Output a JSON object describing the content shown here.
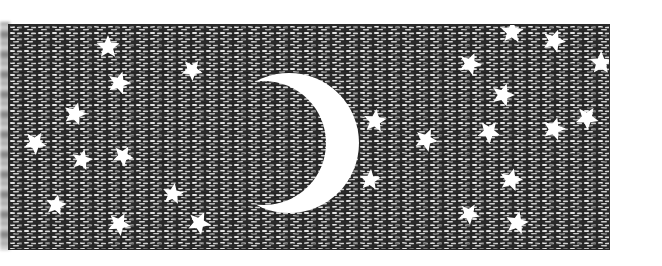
{
  "illustration": {
    "subject": "Crescent moon and stars in a night sky",
    "style": "black-and-white pen hatching",
    "colors": {
      "sky_dark": "#1e1e1e",
      "sky_light": "#e8e8e8",
      "moon": "#ffffff",
      "stars": "#ffffff",
      "page": "#ffffff"
    },
    "moon": {
      "cx": 280,
      "cy": 118,
      "r": 70,
      "cut_cx": 255,
      "cut_cy": 118,
      "cut_r": 62
    },
    "stars": [
      {
        "x": 99,
        "y": 22,
        "r": 12
      },
      {
        "x": 110,
        "y": 58,
        "r": 12
      },
      {
        "x": 183,
        "y": 45,
        "r": 11
      },
      {
        "x": 66,
        "y": 89,
        "r": 12
      },
      {
        "x": 26,
        "y": 118,
        "r": 12
      },
      {
        "x": 73,
        "y": 135,
        "r": 11
      },
      {
        "x": 114,
        "y": 131,
        "r": 11
      },
      {
        "x": 47,
        "y": 180,
        "r": 11
      },
      {
        "x": 110,
        "y": 199,
        "r": 12
      },
      {
        "x": 164,
        "y": 169,
        "r": 11
      },
      {
        "x": 190,
        "y": 198,
        "r": 12
      },
      {
        "x": 366,
        "y": 96,
        "r": 12
      },
      {
        "x": 417,
        "y": 115,
        "r": 12
      },
      {
        "x": 361,
        "y": 155,
        "r": 11
      },
      {
        "x": 461,
        "y": 39,
        "r": 12
      },
      {
        "x": 503,
        "y": 7,
        "r": 12
      },
      {
        "x": 545,
        "y": 16,
        "r": 12
      },
      {
        "x": 592,
        "y": 38,
        "r": 12
      },
      {
        "x": 494,
        "y": 70,
        "r": 12
      },
      {
        "x": 480,
        "y": 107,
        "r": 12
      },
      {
        "x": 545,
        "y": 104,
        "r": 12
      },
      {
        "x": 578,
        "y": 93,
        "r": 12
      },
      {
        "x": 502,
        "y": 155,
        "r": 12
      },
      {
        "x": 460,
        "y": 189,
        "r": 11
      },
      {
        "x": 508,
        "y": 198,
        "r": 12
      }
    ]
  }
}
